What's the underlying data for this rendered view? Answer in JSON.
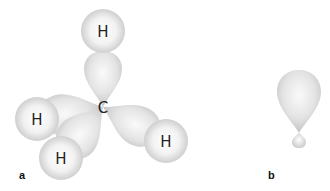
{
  "figure": {
    "panel_a": {
      "label": "a",
      "central_atom": "C",
      "hydrogens": [
        {
          "id": "top",
          "label": "H"
        },
        {
          "id": "left",
          "label": "H"
        },
        {
          "id": "bottom",
          "label": "H"
        },
        {
          "id": "right",
          "label": "H"
        }
      ]
    },
    "panel_b": {
      "label": "b"
    }
  },
  "colors": {
    "orbital_light": "#f7f7f7",
    "orbital_dark": "#c9c9c9",
    "text": "#222222"
  }
}
